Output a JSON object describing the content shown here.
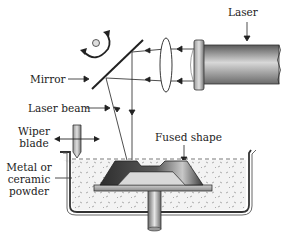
{
  "diagram": {
    "labels": {
      "laser": "Laser",
      "mirror": "Mirror",
      "laser_beam": "Laser beam",
      "wiper_blade_line1": "Wiper",
      "wiper_blade_line2": "blade",
      "fused_shape": "Fused shape",
      "powder_line1": "Metal or",
      "powder_line2": "ceramic",
      "powder_line3": "powder"
    },
    "components": [
      {
        "id": "laser",
        "icon": "laser-cylinder"
      },
      {
        "id": "lens",
        "icon": "convex-lens"
      },
      {
        "id": "mirror",
        "icon": "rotating-mirror"
      },
      {
        "id": "rotation-indicator",
        "icon": "curved-arrow-rotation"
      },
      {
        "id": "wiper-blade",
        "icon": "blade-with-bidirectional-arrow"
      },
      {
        "id": "powder-bed",
        "icon": "container-with-powder"
      },
      {
        "id": "fused-part",
        "icon": "trapezoid-part"
      },
      {
        "id": "build-platform",
        "icon": "platform-with-piston"
      }
    ],
    "colors": {
      "line": "#222222",
      "part_dark": "#3a3a3a",
      "part_light": "#bdbdbd",
      "powder_bg": "#f2f2f2",
      "powder_dots": "#9a9a9a"
    }
  }
}
